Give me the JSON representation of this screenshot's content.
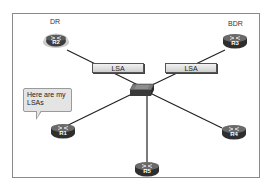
{
  "diagram": {
    "roles": {
      "dr": "DR",
      "bdr": "BDR"
    },
    "routers": [
      {
        "id": "R1",
        "label": "R1",
        "role": ""
      },
      {
        "id": "R2",
        "label": "R2",
        "role": "DR"
      },
      {
        "id": "R3",
        "label": "R3",
        "role": "BDR"
      },
      {
        "id": "R4",
        "label": "R4",
        "role": ""
      },
      {
        "id": "R5",
        "label": "R5",
        "role": ""
      }
    ],
    "switch": {
      "label": "switch"
    },
    "lsa_labels": [
      "LSA",
      "LSA"
    ],
    "speech_bubble": {
      "line1": "Here are my",
      "line2": "LSAs"
    },
    "colors": {
      "router_body": "#3c3c3c",
      "router_highlight_ring": "#c9c9c9",
      "lsa_box": "#d9d9d9",
      "frame_border": "#8a8a8a",
      "bubble_fill": "#e4e4e4"
    }
  }
}
